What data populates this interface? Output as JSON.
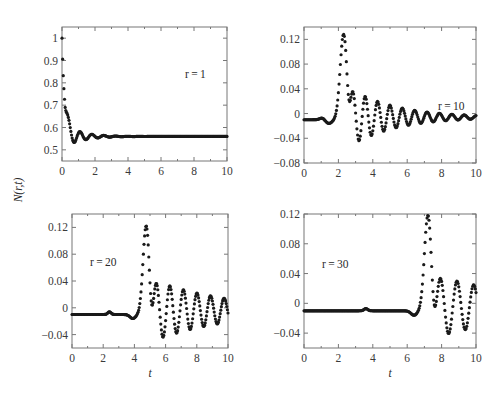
{
  "figure": {
    "ylabel": "N(r,t)",
    "xlabel": "t"
  },
  "chart_data": [
    {
      "type": "scatter",
      "id": "panel-r1",
      "annotation": "r = 1",
      "xlabel": "",
      "ylabel": "N(r,t)",
      "xlim": [
        0,
        10
      ],
      "ylim": [
        0.45,
        1.05
      ],
      "xticks": [
        0,
        2,
        4,
        6,
        8,
        10
      ],
      "yticks": [
        0.5,
        0.6,
        0.7,
        0.8,
        0.9,
        1
      ],
      "ytick_labels": [
        "0.5",
        "0.6",
        "0.7",
        "0.8",
        "0.9",
        "1"
      ],
      "description": "Starts at 1.0, drops sharply to ~0.49 at t≈0.4, damped oscillation settling to ~0.56",
      "x": [
        0,
        0.1,
        0.2,
        0.3,
        0.4,
        0.55,
        0.75,
        1.0,
        1.2,
        1.5,
        1.8,
        2.2,
        2.8,
        3.5,
        4.5,
        6,
        8,
        10
      ],
      "y": [
        1.0,
        0.9,
        0.72,
        0.58,
        0.49,
        0.53,
        0.6,
        0.55,
        0.53,
        0.575,
        0.545,
        0.568,
        0.552,
        0.563,
        0.558,
        0.56,
        0.56,
        0.56
      ],
      "params": {
        "base": 0.56,
        "drop_amp": 0.44,
        "decay": 0.55,
        "osc_amp": 0.07,
        "period": 0.72
      }
    },
    {
      "type": "scatter",
      "id": "panel-r10",
      "annotation": "r = 10",
      "xlim": [
        0,
        10
      ],
      "ylim": [
        -0.08,
        0.14
      ],
      "xticks": [
        0,
        2,
        4,
        6,
        8,
        10
      ],
      "yticks": [
        -0.08,
        -0.04,
        0,
        0.04,
        0.08,
        0.12
      ],
      "ytick_labels": [
        "−0.08",
        "−0.04",
        "0",
        "0.04",
        "0.08",
        "0.12"
      ],
      "description": "Flat at ~-0.01, pulse peak 0.128 at t≈2.3, trough -0.06 at t≈2.9, then decaying oscillations around -0.005",
      "x": [
        0,
        1.0,
        1.6,
        2.3,
        2.9,
        3.35,
        3.75,
        4.15,
        4.55,
        4.9,
        5.6,
        6.3,
        7.0,
        7.7,
        8.4,
        9.1,
        9.8
      ],
      "y": [
        -0.01,
        -0.008,
        -0.013,
        0.128,
        -0.06,
        0.028,
        -0.043,
        0.017,
        -0.03,
        0.01,
        0.006,
        0.005,
        0.004,
        0.003,
        0.002,
        0.001,
        -0.01
      ],
      "params": {
        "base": -0.01,
        "onset": 1.6,
        "peak_t": 2.3,
        "peak": 0.128,
        "osc_period": 0.72
      }
    },
    {
      "type": "scatter",
      "id": "panel-r20",
      "annotation": "r = 20",
      "xlim": [
        0,
        10
      ],
      "ylim": [
        -0.06,
        0.14
      ],
      "xticks": [
        0,
        2,
        4,
        6,
        8,
        10
      ],
      "yticks": [
        -0.04,
        0,
        0.04,
        0.08,
        0.12
      ],
      "ytick_labels": [
        "−0.04",
        "0",
        "0.04",
        "0.08",
        "0.12"
      ],
      "description": "Flat at ~-0.01 with small bump near t≈2.4, pulse peak 0.122 at t≈4.75, trough -0.055 at t≈5.4, oscillations amplitude ~0.03",
      "x": [
        0,
        2.4,
        4.0,
        4.75,
        5.4,
        5.95,
        6.4,
        6.85,
        7.25,
        7.7,
        8.1,
        8.55,
        9.0,
        9.45,
        9.9
      ],
      "y": [
        -0.01,
        -0.007,
        -0.015,
        0.122,
        -0.055,
        0.025,
        -0.04,
        0.018,
        -0.035,
        0.013,
        -0.03,
        0.008,
        -0.028,
        0.006,
        0.005
      ],
      "params": {
        "base": -0.01,
        "onset": 4.05,
        "peak_t": 4.75,
        "peak": 0.122,
        "osc_period": 0.87
      }
    },
    {
      "type": "scatter",
      "id": "panel-r30",
      "annotation": "r = 30",
      "xlim": [
        0,
        10
      ],
      "ylim": [
        -0.06,
        0.12
      ],
      "xticks": [
        0,
        2,
        4,
        6,
        8,
        10
      ],
      "yticks": [
        -0.04,
        0,
        0.04,
        0.08,
        0.12
      ],
      "ytick_labels": [
        "−0.04",
        "0",
        "0.04",
        "0.08",
        "0.12"
      ],
      "description": "Flat at ~-0.01 with small bump near t≈3.6, pulse peak 0.118 at t≈7.2, trough -0.05 at t≈8.0, oscillations to t=10",
      "x": [
        0,
        3.6,
        6.0,
        6.5,
        7.2,
        8.0,
        8.5,
        9.0,
        9.45,
        9.9,
        10
      ],
      "y": [
        -0.01,
        -0.007,
        -0.01,
        -0.017,
        0.118,
        -0.05,
        0.022,
        -0.037,
        0.015,
        -0.032,
        -0.03
      ],
      "params": {
        "base": -0.01,
        "onset": 6.55,
        "peak_t": 7.2,
        "peak": 0.118,
        "osc_period": 0.97
      }
    }
  ]
}
